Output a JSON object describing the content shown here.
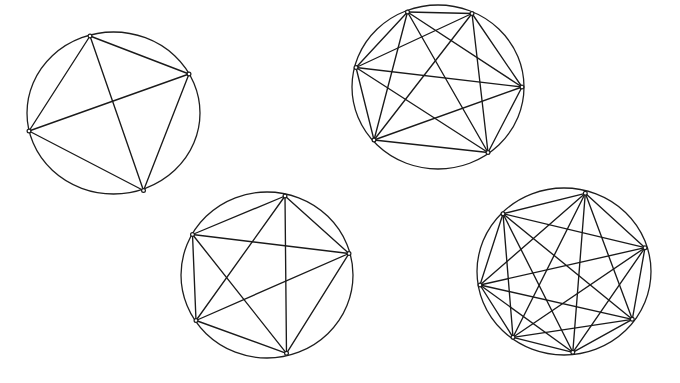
{
  "figure": {
    "width": 680,
    "height": 383,
    "background": "#ffffff",
    "stroke_color": "#1a1a1a"
  },
  "graphs": [
    {
      "id": "k4",
      "label": "K4",
      "circle": {
        "cx": 113.5,
        "cy": 113,
        "rx": 86.5,
        "ry": 81
      },
      "vertices": [
        {
          "x": 90,
          "y": 36
        },
        {
          "x": 189,
          "y": 74
        },
        {
          "x": 29,
          "y": 131
        },
        {
          "x": 143.5,
          "y": 190.5
        }
      ],
      "edges": "complete"
    },
    {
      "id": "k6",
      "label": "K6",
      "circle": {
        "cx": 438,
        "cy": 87,
        "rx": 86,
        "ry": 82
      },
      "vertices": [
        {
          "x": 407.5,
          "y": 12
        },
        {
          "x": 472,
          "y": 13.5
        },
        {
          "x": 356,
          "y": 67.5
        },
        {
          "x": 522,
          "y": 87
        },
        {
          "x": 374,
          "y": 140
        },
        {
          "x": 488,
          "y": 152.5
        }
      ],
      "edges": "complete"
    },
    {
      "id": "k5",
      "label": "K5",
      "circle": {
        "cx": 267,
        "cy": 275,
        "rx": 86,
        "ry": 83
      },
      "vertices": [
        {
          "x": 285,
          "y": 196
        },
        {
          "x": 192.5,
          "y": 234.5
        },
        {
          "x": 349,
          "y": 253.5
        },
        {
          "x": 196,
          "y": 320.5
        },
        {
          "x": 286.5,
          "y": 353.3
        }
      ],
      "edges": "complete"
    },
    {
      "id": "k7",
      "label": "K7",
      "circle": {
        "cx": 564,
        "cy": 271.5,
        "rx": 87,
        "ry": 83.5
      },
      "vertices": [
        {
          "x": 585.3,
          "y": 193.3
        },
        {
          "x": 503,
          "y": 213.7
        },
        {
          "x": 645,
          "y": 247.7
        },
        {
          "x": 480,
          "y": 285
        },
        {
          "x": 632.3,
          "y": 319.3
        },
        {
          "x": 513,
          "y": 337.3
        },
        {
          "x": 572.8,
          "y": 352.3
        }
      ],
      "edges": "complete"
    }
  ]
}
